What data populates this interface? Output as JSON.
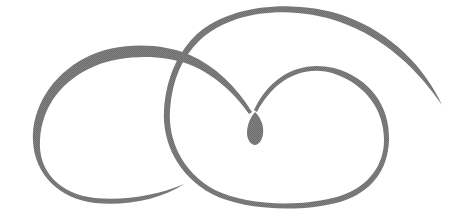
{
  "image": {
    "description": "Decorative calligraphic ornament made of two interlocking swirl loops meeting at a central teardrop",
    "background": "#ffffff",
    "ink_color": "#7a7a7a",
    "elements": [
      {
        "name": "left-loop-swirl",
        "shape": "open loop, tapering tail at lower-right"
      },
      {
        "name": "big-arc-swirl",
        "shape": "large arc from right tail over top, forming right loop"
      },
      {
        "name": "center-teardrop",
        "shape": "teardrop where the two strokes meet"
      }
    ]
  }
}
